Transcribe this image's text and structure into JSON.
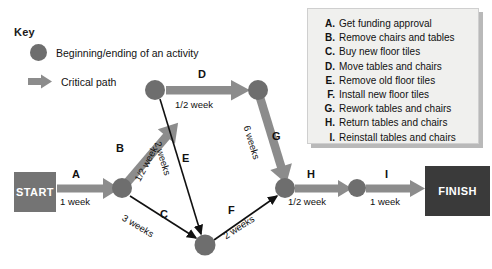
{
  "key": {
    "title": "Key",
    "items": [
      {
        "icon": "circle-node-icon",
        "label": "Beginning/ending of an activity"
      },
      {
        "icon": "thick-arrow-icon",
        "label": "Critical path"
      }
    ]
  },
  "legend": {
    "items": [
      {
        "key": "A.",
        "text": "Get funding approval"
      },
      {
        "key": "B.",
        "text": "Remove chairs and tables"
      },
      {
        "key": "C.",
        "text": "Buy new floor tiles"
      },
      {
        "key": "D.",
        "text": "Move tables and chairs"
      },
      {
        "key": "E.",
        "text": "Remove old floor tiles"
      },
      {
        "key": "F.",
        "text": "Install new floor tiles"
      },
      {
        "key": "G.",
        "text": "Rework tables and chairs"
      },
      {
        "key": "H.",
        "text": "Return tables and chairs"
      },
      {
        "key": "I.",
        "text": "Reinstall tables and chairs"
      }
    ]
  },
  "diagram": {
    "start_label": "START",
    "finish_label": "FINISH",
    "colors": {
      "critical_path": "#8c8c8c",
      "node": "#6e6e6e",
      "start_box": "#747474",
      "finish_box": "#3a3a3a",
      "normal_path": "#111111",
      "legend_bg": "#f0f0ee"
    },
    "edges": [
      {
        "id": "A",
        "letter": "A",
        "duration": "1 week",
        "from": "START",
        "to": "n1",
        "critical": true
      },
      {
        "id": "B",
        "letter": "B",
        "duration": "1/2 week",
        "from": "n1",
        "to": "n2",
        "critical": true
      },
      {
        "id": "C",
        "letter": "C",
        "duration": "3 weeks",
        "from": "n1",
        "to": "n4",
        "critical": false
      },
      {
        "id": "D",
        "letter": "D",
        "duration": "1/2 week",
        "from": "n2",
        "to": "n3",
        "critical": true
      },
      {
        "id": "E",
        "letter": "E",
        "duration": "2 weeks",
        "from": "n2",
        "to": "n4",
        "critical": false
      },
      {
        "id": "F",
        "letter": "F",
        "duration": "2 weeks",
        "from": "n4",
        "to": "n5",
        "critical": false
      },
      {
        "id": "G",
        "letter": "G",
        "duration": "6 weeks",
        "from": "n3",
        "to": "n5",
        "critical": true
      },
      {
        "id": "H",
        "letter": "H",
        "duration": "1/2 week",
        "from": "n5",
        "to": "n6",
        "critical": true
      },
      {
        "id": "I",
        "letter": "I",
        "duration": "1 week",
        "from": "n6",
        "to": "FINISH",
        "critical": true
      }
    ]
  }
}
